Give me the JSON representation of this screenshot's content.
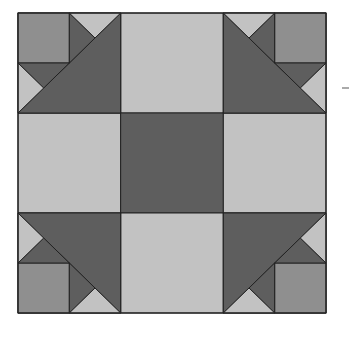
{
  "colors": {
    "light": "#c2c2c2",
    "medium": "#8f8f8f",
    "dark": "#5e5e5e",
    "outline": "#222222"
  },
  "block": {
    "grid": "3x3",
    "center": "dark",
    "edges": "light",
    "corners": [
      "top-left",
      "top-right",
      "bottom-left",
      "bottom-right"
    ]
  }
}
